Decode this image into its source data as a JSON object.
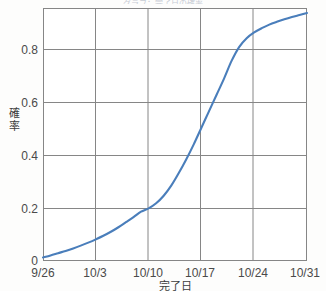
{
  "chart_data": {
    "type": "line",
    "title": "",
    "xlabel": "完了日",
    "ylabel": "確率",
    "grid": true,
    "legend": "none",
    "xtick_labels": [
      "9/26",
      "10/3",
      "10/10",
      "10/17",
      "10/24",
      "10/31"
    ],
    "ytick_labels": [
      "0",
      "0.2",
      "0.4",
      "0.6",
      "0.8"
    ],
    "ytick_values": [
      0,
      0.2,
      0.4,
      0.6,
      0.8
    ],
    "ylim": [
      0,
      1.0
    ],
    "xlim": [
      0,
      35
    ],
    "series": [
      {
        "name": "cumulative-probability",
        "color": "#4a7ebb",
        "x": [
          0,
          1,
          2,
          3,
          4,
          5,
          6,
          7,
          8,
          9,
          10,
          11,
          12,
          13,
          14,
          15,
          16,
          17,
          18,
          19,
          20,
          21,
          22,
          23,
          24,
          25,
          26,
          27,
          28,
          29,
          30,
          31,
          32,
          33,
          34,
          35
        ],
        "y": [
          0.01,
          0.018,
          0.027,
          0.036,
          0.046,
          0.057,
          0.069,
          0.082,
          0.096,
          0.112,
          0.13,
          0.15,
          0.17,
          0.192,
          0.205,
          0.225,
          0.255,
          0.295,
          0.345,
          0.4,
          0.46,
          0.525,
          0.59,
          0.655,
          0.72,
          0.79,
          0.845,
          0.88,
          0.903,
          0.92,
          0.934,
          0.945,
          0.955,
          0.964,
          0.972,
          0.98
        ]
      }
    ]
  },
  "clipped_header": "グラフ：完了日の確率"
}
